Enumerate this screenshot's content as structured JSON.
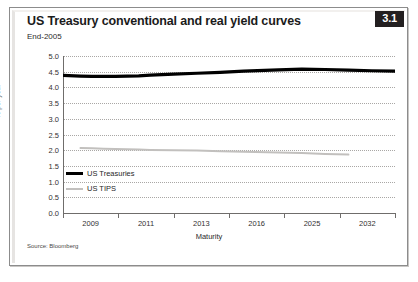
{
  "figure": {
    "badge": "3.1",
    "title": "US Treasury conventional and real yield curves",
    "subtitle": "End-2005",
    "source": "Source: Bloomberg"
  },
  "colors": {
    "treasuries": "#000000",
    "tips": "#c2c0be",
    "grid": "#a9a7a5",
    "axis": "#6f6d6b",
    "badge_bg": "#231f20",
    "page_bg": "#ffffff"
  },
  "chart_data": {
    "type": "line",
    "title": "US Treasury conventional and real yield curves",
    "subtitle": "End-2005",
    "xlabel": "Maturity",
    "ylabel": "% per year",
    "ylim": [
      0.0,
      5.0
    ],
    "yticks": [
      "0.0",
      "0.5",
      "1.0",
      "1.5",
      "2.0",
      "2.5",
      "3.0",
      "3.5",
      "4.0",
      "4.5",
      "5.0"
    ],
    "xticks": [
      "2009",
      "2011",
      "2013",
      "2016",
      "2025",
      "2032"
    ],
    "grid": "horizontal-dotted",
    "legend_position": "inside-lower-left",
    "series": [
      {
        "name": "US Treasuries",
        "color": "#000000",
        "x": [
          2006.5,
          2008,
          2009,
          2010,
          2011,
          2012,
          2013,
          2014,
          2016,
          2018,
          2020,
          2022,
          2025,
          2027,
          2029,
          2031,
          2033,
          2035
        ],
        "values": [
          4.38,
          4.36,
          4.35,
          4.35,
          4.35,
          4.36,
          4.37,
          4.39,
          4.42,
          4.45,
          4.48,
          4.52,
          4.56,
          4.58,
          4.57,
          4.55,
          4.53,
          4.52
        ]
      },
      {
        "name": "US TIPS",
        "color": "#c2c0be",
        "x": [
          2008,
          2009,
          2010,
          2011,
          2012,
          2013,
          2014,
          2016,
          2018,
          2020,
          2022,
          2025,
          2027,
          2029,
          2031
        ],
        "values": [
          2.07,
          2.06,
          2.05,
          2.04,
          2.03,
          2.02,
          2.01,
          2.0,
          1.99,
          1.97,
          1.95,
          1.93,
          1.91,
          1.88,
          1.86
        ]
      }
    ]
  },
  "legend": [
    {
      "label": "US Treasuries"
    },
    {
      "label": "US TIPS"
    }
  ]
}
